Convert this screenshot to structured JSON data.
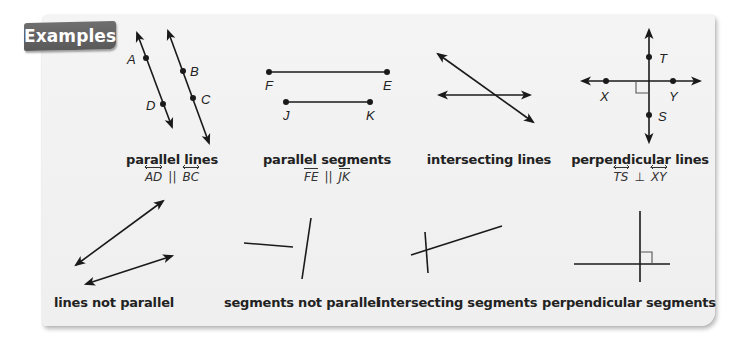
{
  "banner": {
    "label": "Examples"
  },
  "colors": {
    "card_background": "#f1f1f1",
    "banner_background": "#636363",
    "banner_text": "#ffffff",
    "ink": "#222222"
  },
  "examples_row1": [
    {
      "caption": "parallel lines",
      "notation": {
        "left": "AD",
        "relation": "||",
        "right": "BC",
        "type": "line"
      },
      "points": [
        "A",
        "B",
        "C",
        "D"
      ]
    },
    {
      "caption": "parallel segments",
      "notation": {
        "left": "FE",
        "relation": "||",
        "right": "JK",
        "type": "segment"
      },
      "points": [
        "F",
        "E",
        "J",
        "K"
      ]
    },
    {
      "caption": "intersecting lines"
    },
    {
      "caption": "perpendicular lines",
      "notation": {
        "left": "TS",
        "relation": "⊥",
        "right": "XY",
        "type": "line"
      },
      "points": [
        "T",
        "X",
        "Y",
        "S"
      ]
    }
  ],
  "examples_row2": [
    {
      "caption": "lines not parallel"
    },
    {
      "caption": "segments not parallel"
    },
    {
      "caption": "intersecting segments"
    },
    {
      "caption": "perpendicular segments"
    }
  ]
}
